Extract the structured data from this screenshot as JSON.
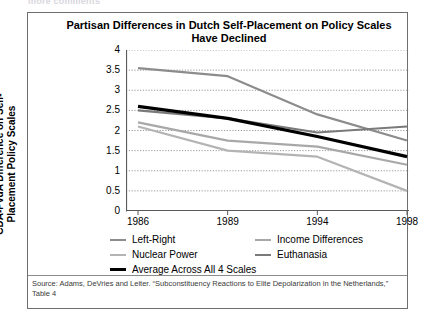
{
  "top_strip": {
    "ghost_text": "more comments"
  },
  "figure": {
    "title": "Partisan Differences in Dutch Self-Placement on Policy Scales Have Declined",
    "ylabel": "CDA-PvdA Difference on Self-Placement Policy Scales",
    "source_note": "Source: Adams, DeVries and Leiter. “Subconstituency Reactions to Elite Depolarization in the Netherlands,” Table 4"
  },
  "chart_data": {
    "type": "line",
    "title": "Partisan Differences in Dutch Self-Placement on Policy Scales Have Declined",
    "xlabel": "",
    "ylabel": "CDA-PvdA Difference on Self-Placement Policy Scales",
    "categories": [
      "1986",
      "1989",
      "1994",
      "1998"
    ],
    "ylim": [
      0,
      4
    ],
    "ytick_labels": [
      "4",
      "3.5",
      "3",
      "2.5",
      "2",
      "1.5",
      "1",
      "0.5",
      "0"
    ],
    "ytick_values": [
      4,
      3.5,
      3,
      2.5,
      2,
      1.5,
      1,
      0.5,
      0
    ],
    "grid": "horizontal-dotted",
    "legend_position": "bottom",
    "series": [
      {
        "name": "Left-Right",
        "color": "#8c8c8c",
        "width": 2.2,
        "values": [
          3.55,
          3.35,
          2.4,
          1.75
        ]
      },
      {
        "name": "Income Differences",
        "color": "#a8a8a8",
        "width": 2.2,
        "values": [
          2.2,
          1.75,
          1.6,
          1.15
        ]
      },
      {
        "name": "Nuclear Power",
        "color": "#b4b4b4",
        "width": 2.2,
        "values": [
          2.1,
          1.5,
          1.35,
          0.5
        ]
      },
      {
        "name": "Euthanasia",
        "color": "#7a7a7a",
        "width": 2.2,
        "values": [
          2.5,
          2.3,
          1.95,
          2.1
        ]
      },
      {
        "name": "Average Across All 4 Scales",
        "color": "#000000",
        "width": 3.2,
        "values": [
          2.6,
          2.3,
          1.85,
          1.35
        ]
      }
    ]
  },
  "legend": {
    "rows": [
      [
        {
          "label": "Left-Right",
          "color": "#8c8c8c",
          "thick": false
        },
        {
          "label": "Income Differences",
          "color": "#a8a8a8",
          "thick": false
        }
      ],
      [
        {
          "label": "Nuclear Power",
          "color": "#b4b4b4",
          "thick": false
        },
        {
          "label": "Euthanasia",
          "color": "#7a7a7a",
          "thick": false
        }
      ],
      [
        {
          "label": "Average Across All 4 Scales",
          "color": "#000000",
          "thick": true
        }
      ]
    ]
  }
}
